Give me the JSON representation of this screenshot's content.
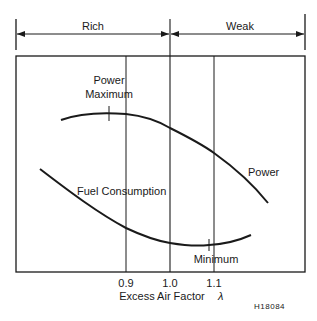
{
  "diagram": {
    "type": "engine-characteristic",
    "regions": [
      {
        "label": "Rich",
        "from": "left",
        "to": "1.0"
      },
      {
        "label": "Weak",
        "from": "1.0",
        "to": "right"
      }
    ],
    "x_axis": {
      "label": "Excess Air Factor",
      "symbol": "λ",
      "ticks": [
        "0.9",
        "1.0",
        "1.1"
      ]
    },
    "curves": [
      {
        "name": "Power",
        "label": "Power",
        "marker_label": "Power Maximum",
        "marker_line1": "Power",
        "marker_line2": "Maximum"
      },
      {
        "name": "Fuel Consumption",
        "label": "Fuel Consumption",
        "marker_label": "Minimum"
      }
    ],
    "figure_code": "H18084",
    "colors": {
      "ink": "#1a1a1a",
      "background": "#ffffff"
    }
  }
}
